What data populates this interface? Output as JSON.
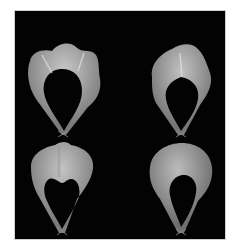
{
  "figure": {
    "background": "#030303",
    "frame_color": "#cfcfcf",
    "shape_color": "#bdbdbd",
    "panels": [
      {
        "position": "top-left",
        "description": "wavy-lobed canopy shape"
      },
      {
        "position": "top-right",
        "description": "double-lobed canopy shape"
      },
      {
        "position": "bottom-left",
        "description": "heart-notched canopy shape"
      },
      {
        "position": "bottom-right",
        "description": "smooth dome canopy shape"
      }
    ]
  }
}
